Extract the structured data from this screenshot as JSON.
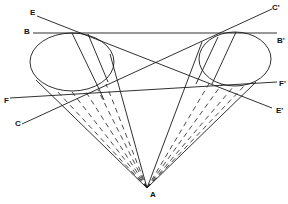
{
  "figure": {
    "type": "geometric-diagram",
    "stroke_color": "#1a1a1a",
    "background": "#ffffff"
  },
  "labels": {
    "A": "A",
    "B": "B",
    "B_prime": "B'",
    "C": "C",
    "C_prime": "C'",
    "E": "E",
    "E_prime": "E'",
    "F": "F",
    "F_prime": "F'"
  },
  "points": {
    "apex_A": [
      147,
      188
    ]
  },
  "ellipses": [
    {
      "name": "left-ellipse",
      "cx": 72,
      "cy": 62,
      "rx": 42,
      "ry": 29
    },
    {
      "name": "right-ellipse",
      "cx": 235,
      "cy": 59,
      "rx": 36,
      "ry": 27
    }
  ],
  "lines": [
    {
      "name": "line-B-Bprime",
      "from": [
        33,
        33
      ],
      "to": [
        277,
        33
      ]
    },
    {
      "name": "line-E-Eprime",
      "from": [
        37,
        16
      ],
      "to": [
        272,
        108
      ]
    },
    {
      "name": "line-C-Cprime",
      "from": [
        22,
        124
      ],
      "to": [
        272,
        9
      ]
    },
    {
      "name": "line-F-Fprime",
      "from": [
        10,
        98
      ],
      "to": [
        277,
        82
      ]
    }
  ]
}
